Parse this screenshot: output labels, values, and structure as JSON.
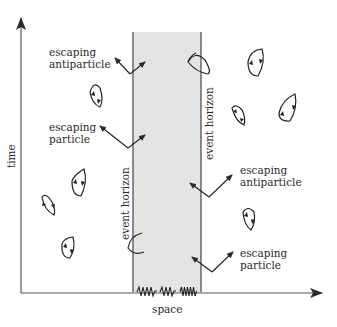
{
  "diagram": {
    "axes": {
      "y_label": "time",
      "x_label": "space"
    },
    "region": {
      "left_horizon_label": "event horizon",
      "right_horizon_label": "event horizon",
      "fill_color": "#e4e4e4"
    },
    "annotations": [
      {
        "line1": "escaping",
        "line2": "antiparticle"
      },
      {
        "line1": "escaping",
        "line2": "particle"
      },
      {
        "line1": "escaping",
        "line2": "antiparticle"
      },
      {
        "line1": "escaping",
        "line2": "particle"
      }
    ],
    "colors": {
      "ink": "#2a2a2a",
      "axis": "#555555"
    }
  }
}
